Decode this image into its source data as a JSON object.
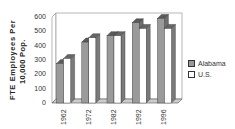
{
  "chart_data": {
    "type": "bar",
    "title": "",
    "xlabel": "",
    "ylabel": "FTE Employees Per 10,000 Pop.",
    "ylabel_lines": [
      "FTE Employees Per",
      "10,000 Pop."
    ],
    "categories": [
      "1962",
      "1972",
      "1982",
      "1992",
      "1996"
    ],
    "series": [
      {
        "name": "Alabama",
        "values": [
          275,
          425,
          470,
          560,
          590
        ],
        "color": "#9a9a9a"
      },
      {
        "name": "U.S.",
        "values": [
          310,
          455,
          470,
          520,
          520
        ],
        "color": "#ffffff"
      }
    ],
    "ylim": [
      0,
      600
    ],
    "yticks": [
      "0",
      "100",
      "200",
      "300",
      "400",
      "500",
      "600"
    ],
    "grid": false,
    "legend_position": "right",
    "style": "3d-column"
  }
}
